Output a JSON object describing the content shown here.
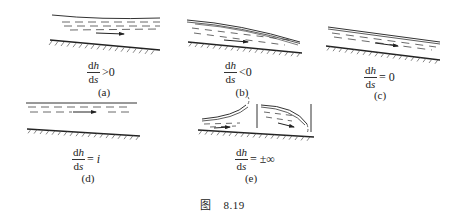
{
  "figure": {
    "caption_prefix": "图",
    "caption_number": "8.19",
    "panels": [
      {
        "id": "a",
        "label": "(a)",
        "num_d": "d",
        "num_var": "h",
        "den_d": "d",
        "den_var": "s",
        "relation": ">0",
        "description": "water depth increasing downstream"
      },
      {
        "id": "b",
        "label": "(b)",
        "num_d": "d",
        "num_var": "h",
        "den_d": "d",
        "den_var": "s",
        "relation": "<0",
        "description": "water depth decreasing downstream"
      },
      {
        "id": "c",
        "label": "(c)",
        "num_d": "d",
        "num_var": "h",
        "den_d": "d",
        "den_var": "s",
        "relation": "= 0",
        "description": "uniform flow, surface parallel to bed"
      },
      {
        "id": "d",
        "label": "(d)",
        "num_d": "d",
        "num_var": "h",
        "den_d": "d",
        "den_var": "s",
        "relation": "= ",
        "relation_var": "i",
        "description": "horizontal water surface"
      },
      {
        "id": "e",
        "label": "(e)",
        "num_d": "d",
        "num_var": "h",
        "den_d": "d",
        "den_var": "s",
        "relation": "= ±∞",
        "description": "surface perpendicular to bed (hydraulic jump / drop)"
      }
    ]
  },
  "colors": {
    "line": "#333333",
    "hatch": "#555555",
    "water_dash": "#444444"
  }
}
